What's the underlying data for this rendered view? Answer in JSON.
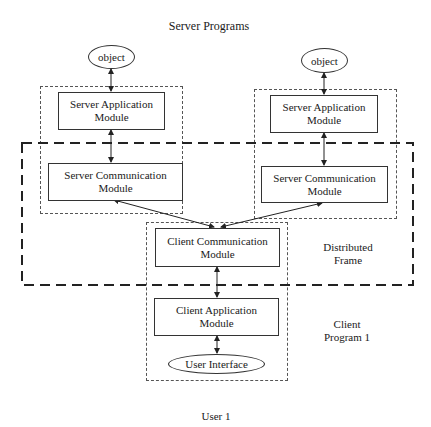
{
  "title": "Server Programs",
  "servers": [
    {
      "object_label": "object",
      "app_module": [
        "Server Application",
        "Module"
      ],
      "comm_module": [
        "Server Communication",
        "Module"
      ]
    },
    {
      "object_label": "object",
      "app_module": [
        "Server Application",
        "Module"
      ],
      "comm_module": [
        "Server Communication",
        "Module"
      ]
    }
  ],
  "client": {
    "comm_module": [
      "Client Communication",
      "Module"
    ],
    "app_module": [
      "Client Application",
      "Module"
    ],
    "ui_label": "User Interface",
    "program_label": [
      "Client",
      "Program 1"
    ]
  },
  "frame_label": [
    "Distributed",
    "Frame"
  ],
  "user_label": "User 1"
}
